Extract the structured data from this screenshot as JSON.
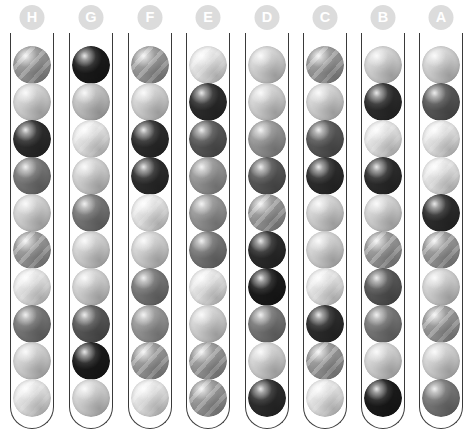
{
  "app": {
    "title": "Ball Sort Puzzle Board",
    "background_color": "#ffffff",
    "tube_outline_color": "#3a3a3a",
    "label_bg_color": "#dcdcdc",
    "label_text_color": "#ffffff"
  },
  "layout": {
    "width": 473,
    "height": 437,
    "tube_count": 8,
    "balls_per_tube": 10,
    "tube_width": 44,
    "ball_size": 38,
    "tube_left_positions": [
      10,
      69,
      128,
      186,
      245,
      303,
      361,
      419
    ],
    "tube_top": 33,
    "tube_height": 396,
    "ball_row_tops": [
      13,
      50,
      87,
      124,
      161,
      198,
      235,
      272,
      309,
      346
    ]
  },
  "palette": {
    "very_light": "#ebebeb",
    "light": "#d7d7d7",
    "light_med": "#c6c6c6",
    "medium": "#9a9a9a",
    "med_dark": "#7a7a7a",
    "dark": "#5a5a5a",
    "very_dark": "#2e2e2e",
    "near_black": "#1c1c1c"
  },
  "tubes": [
    {
      "label": "H",
      "name": "tube-h",
      "balls": [
        {
          "shade": "medium",
          "color": "#9a9a9a",
          "striped": true
        },
        {
          "shade": "light",
          "color": "#d7d7d7",
          "striped": false
        },
        {
          "shade": "very_dark",
          "color": "#2e2e2e",
          "striped": false
        },
        {
          "shade": "med_dark",
          "color": "#7a7a7a",
          "striped": false
        },
        {
          "shade": "light",
          "color": "#d7d7d7",
          "striped": false
        },
        {
          "shade": "medium",
          "color": "#9a9a9a",
          "striped": true
        },
        {
          "shade": "very_light",
          "color": "#ebebeb",
          "striped": true
        },
        {
          "shade": "med_dark",
          "color": "#7a7a7a",
          "striped": false
        },
        {
          "shade": "light",
          "color": "#d7d7d7",
          "striped": false
        },
        {
          "shade": "very_light",
          "color": "#ebebeb",
          "striped": true
        }
      ]
    },
    {
      "label": "G",
      "name": "tube-g",
      "balls": [
        {
          "shade": "near_black",
          "color": "#1c1c1c",
          "striped": false
        },
        {
          "shade": "light_med",
          "color": "#c6c6c6",
          "striped": false
        },
        {
          "shade": "very_light",
          "color": "#ebebeb",
          "striped": true
        },
        {
          "shade": "light",
          "color": "#d7d7d7",
          "striped": false
        },
        {
          "shade": "med_dark",
          "color": "#7a7a7a",
          "striped": false
        },
        {
          "shade": "light",
          "color": "#d7d7d7",
          "striped": false
        },
        {
          "shade": "light",
          "color": "#d7d7d7",
          "striped": false
        },
        {
          "shade": "dark",
          "color": "#5a5a5a",
          "striped": false
        },
        {
          "shade": "near_black",
          "color": "#1c1c1c",
          "striped": false
        },
        {
          "shade": "light",
          "color": "#d7d7d7",
          "striped": false
        }
      ]
    },
    {
      "label": "F",
      "name": "tube-f",
      "balls": [
        {
          "shade": "medium",
          "color": "#9a9a9a",
          "striped": true
        },
        {
          "shade": "light",
          "color": "#d7d7d7",
          "striped": false
        },
        {
          "shade": "very_dark",
          "color": "#2e2e2e",
          "striped": false
        },
        {
          "shade": "very_dark",
          "color": "#2e2e2e",
          "striped": false
        },
        {
          "shade": "very_light",
          "color": "#ebebeb",
          "striped": true
        },
        {
          "shade": "light",
          "color": "#d7d7d7",
          "striped": false
        },
        {
          "shade": "med_dark",
          "color": "#7a7a7a",
          "striped": false
        },
        {
          "shade": "medium",
          "color": "#9a9a9a",
          "striped": false
        },
        {
          "shade": "medium",
          "color": "#9a9a9a",
          "striped": true
        },
        {
          "shade": "very_light",
          "color": "#ebebeb",
          "striped": true
        }
      ]
    },
    {
      "label": "E",
      "name": "tube-e",
      "balls": [
        {
          "shade": "very_light",
          "color": "#ebebeb",
          "striped": true
        },
        {
          "shade": "very_dark",
          "color": "#2e2e2e",
          "striped": false
        },
        {
          "shade": "dark",
          "color": "#5a5a5a",
          "striped": false
        },
        {
          "shade": "medium",
          "color": "#9a9a9a",
          "striped": false
        },
        {
          "shade": "medium",
          "color": "#9a9a9a",
          "striped": false
        },
        {
          "shade": "med_dark",
          "color": "#7a7a7a",
          "striped": false
        },
        {
          "shade": "very_light",
          "color": "#ebebeb",
          "striped": true
        },
        {
          "shade": "light",
          "color": "#d7d7d7",
          "striped": false
        },
        {
          "shade": "medium",
          "color": "#9a9a9a",
          "striped": true
        },
        {
          "shade": "medium",
          "color": "#9a9a9a",
          "striped": true
        }
      ]
    },
    {
      "label": "D",
      "name": "tube-d",
      "balls": [
        {
          "shade": "light",
          "color": "#d7d7d7",
          "striped": false
        },
        {
          "shade": "light",
          "color": "#d7d7d7",
          "striped": false
        },
        {
          "shade": "medium",
          "color": "#9a9a9a",
          "striped": false
        },
        {
          "shade": "dark",
          "color": "#5a5a5a",
          "striped": false
        },
        {
          "shade": "medium",
          "color": "#9a9a9a",
          "striped": true
        },
        {
          "shade": "very_dark",
          "color": "#2e2e2e",
          "striped": false
        },
        {
          "shade": "near_black",
          "color": "#1c1c1c",
          "striped": false
        },
        {
          "shade": "med_dark",
          "color": "#7a7a7a",
          "striped": false
        },
        {
          "shade": "light",
          "color": "#d7d7d7",
          "striped": false
        },
        {
          "shade": "very_dark",
          "color": "#2e2e2e",
          "striped": false
        }
      ]
    },
    {
      "label": "C",
      "name": "tube-c",
      "balls": [
        {
          "shade": "medium",
          "color": "#9a9a9a",
          "striped": true
        },
        {
          "shade": "light",
          "color": "#d7d7d7",
          "striped": false
        },
        {
          "shade": "dark",
          "color": "#5a5a5a",
          "striped": false
        },
        {
          "shade": "very_dark",
          "color": "#2e2e2e",
          "striped": false
        },
        {
          "shade": "light",
          "color": "#d7d7d7",
          "striped": false
        },
        {
          "shade": "light",
          "color": "#d7d7d7",
          "striped": false
        },
        {
          "shade": "very_light",
          "color": "#ebebeb",
          "striped": true
        },
        {
          "shade": "very_dark",
          "color": "#2e2e2e",
          "striped": false
        },
        {
          "shade": "medium",
          "color": "#9a9a9a",
          "striped": true
        },
        {
          "shade": "very_light",
          "color": "#ebebeb",
          "striped": true
        }
      ]
    },
    {
      "label": "B",
      "name": "tube-b",
      "balls": [
        {
          "shade": "light",
          "color": "#d7d7d7",
          "striped": false
        },
        {
          "shade": "very_dark",
          "color": "#2e2e2e",
          "striped": false
        },
        {
          "shade": "very_light",
          "color": "#ebebeb",
          "striped": true
        },
        {
          "shade": "very_dark",
          "color": "#2e2e2e",
          "striped": false
        },
        {
          "shade": "light",
          "color": "#d7d7d7",
          "striped": false
        },
        {
          "shade": "medium",
          "color": "#9a9a9a",
          "striped": true
        },
        {
          "shade": "dark",
          "color": "#5a5a5a",
          "striped": false
        },
        {
          "shade": "med_dark",
          "color": "#7a7a7a",
          "striped": false
        },
        {
          "shade": "light",
          "color": "#d7d7d7",
          "striped": false
        },
        {
          "shade": "near_black",
          "color": "#1c1c1c",
          "striped": false
        }
      ]
    },
    {
      "label": "A",
      "name": "tube-a",
      "balls": [
        {
          "shade": "light",
          "color": "#d7d7d7",
          "striped": false
        },
        {
          "shade": "dark",
          "color": "#5a5a5a",
          "striped": false
        },
        {
          "shade": "very_light",
          "color": "#ebebeb",
          "striped": true
        },
        {
          "shade": "very_light",
          "color": "#ebebeb",
          "striped": true
        },
        {
          "shade": "very_dark",
          "color": "#2e2e2e",
          "striped": false
        },
        {
          "shade": "medium",
          "color": "#9a9a9a",
          "striped": true
        },
        {
          "shade": "light",
          "color": "#d7d7d7",
          "striped": false
        },
        {
          "shade": "medium",
          "color": "#9a9a9a",
          "striped": true
        },
        {
          "shade": "light",
          "color": "#d7d7d7",
          "striped": false
        },
        {
          "shade": "med_dark",
          "color": "#7a7a7a",
          "striped": false
        }
      ]
    }
  ]
}
